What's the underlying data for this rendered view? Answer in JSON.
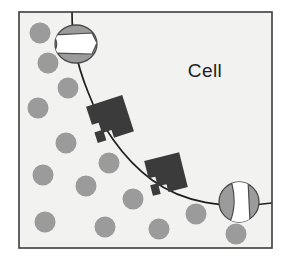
{
  "figure": {
    "kind": "cell-membrane-diagram",
    "width": 293,
    "height": 265,
    "page_background": "#ffffff",
    "panel": {
      "name": "cell-panel",
      "x": 19,
      "y": 12,
      "width": 253,
      "height": 236,
      "fill": "#f2f2f0",
      "border_color": "#3c3c3c",
      "border_width": 1.6
    },
    "labels": {
      "cell": "Cell"
    },
    "label_positions": {
      "cell": {
        "x": 205,
        "y": 77
      }
    },
    "colors": {
      "panel_fill": "#f2f2f0",
      "border": "#3c3c3c",
      "membrane_line": "#231f20",
      "molecule_fill": "#9b9b9b",
      "molecule_stroke": "#8a8a8a",
      "channel_fill": "#9b9b9b",
      "channel_stroke": "#4a4a4a",
      "channel_pore": "#ffffff",
      "receptor_fill": "#3b3b3b",
      "text": "#231f20"
    },
    "membrane": {
      "name": "membrane-curve",
      "stroke_width": 1.7,
      "path": "M 72 12 C 72 40 76 62 88 92 C 100 124 122 158 152 180 C 182 202 224 210 272 203",
      "description": "cell membrane boundary curve"
    },
    "molecules": [
      {
        "id": 1,
        "cx": 40,
        "cy": 33,
        "r": 10.5
      },
      {
        "id": 2,
        "cx": 48,
        "cy": 63,
        "r": 10.5
      },
      {
        "id": 3,
        "cx": 68,
        "cy": 88,
        "r": 10.5
      },
      {
        "id": 4,
        "cx": 38,
        "cy": 108,
        "r": 10.5
      },
      {
        "id": 5,
        "cx": 66,
        "cy": 143,
        "r": 10.5
      },
      {
        "id": 6,
        "cx": 43,
        "cy": 175,
        "r": 10.5
      },
      {
        "id": 7,
        "cx": 86,
        "cy": 186,
        "r": 10.5
      },
      {
        "id": 8,
        "cx": 109,
        "cy": 163,
        "r": 10.5
      },
      {
        "id": 9,
        "cx": 133,
        "cy": 199,
        "r": 10.5
      },
      {
        "id": 10,
        "cx": 45,
        "cy": 222,
        "r": 10.5
      },
      {
        "id": 11,
        "cx": 105,
        "cy": 227,
        "r": 10.5
      },
      {
        "id": 12,
        "cx": 159,
        "cy": 229,
        "r": 10.5
      },
      {
        "id": 13,
        "cx": 196,
        "cy": 214,
        "r": 10.5
      },
      {
        "id": 14,
        "cx": 236,
        "cy": 234,
        "r": 10.5
      }
    ],
    "channel_proteins": [
      {
        "id": "channel-top",
        "name": "channel-protein-top",
        "cx": 76,
        "cy": 44,
        "rx": 21,
        "ry": 19,
        "orientation": "horizontal",
        "pore_label": "open pore"
      },
      {
        "id": "channel-right",
        "name": "channel-protein-right",
        "cx": 239,
        "cy": 202,
        "rx": 20,
        "ry": 20,
        "orientation": "vertical",
        "pore_label": "open pore"
      }
    ],
    "receptor_proteins": [
      {
        "id": "receptor-upper",
        "name": "receptor-protein-upper",
        "cx": 110,
        "cy": 119,
        "size": 38,
        "rotation": -18
      },
      {
        "id": "receptor-lower",
        "name": "receptor-protein-lower",
        "cx": 166,
        "cy": 174,
        "size": 36,
        "rotation": -14
      }
    ]
  }
}
